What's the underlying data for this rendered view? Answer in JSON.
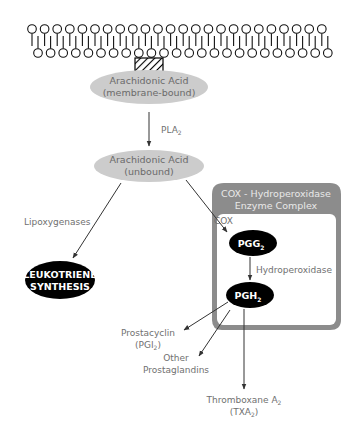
{
  "diagram": {
    "membrane": {
      "type": "phospholipid-bilayer",
      "top_heads": 24,
      "bottom_heads": 24,
      "embedded_marker": "hatched-box"
    },
    "nodes": {
      "aa_membrane": {
        "line1": "Arachidonic Acid",
        "line2": "(membrane-bound)"
      },
      "aa_unbound": {
        "line1": "Arachidonic Acid",
        "line2": "(unbound)"
      },
      "leukotriene": {
        "line1": "LEUKOTRIENE",
        "line2": "SYNTHESIS"
      },
      "pgg2": {
        "main": "PGG",
        "sub": "2"
      },
      "pgh2": {
        "main": "PGH",
        "sub": "2"
      },
      "prostacyclin": {
        "line1": "Prostacyclin",
        "line2_pre": "(PGI",
        "line2_sub": "2",
        "line2_post": ")"
      },
      "other_pg": {
        "line1": "Other",
        "line2": "Prostaglandins"
      },
      "thromboxane": {
        "line1_pre": "Thromboxane A",
        "line1_sub": "2",
        "line2_pre": "(TXA",
        "line2_sub": "2",
        "line2_post": ")"
      }
    },
    "enzymes": {
      "pla2": {
        "main": "PLA",
        "sub": "2"
      },
      "lipoxygenases": "Lipoxygenases",
      "cox": "COX",
      "hydroperoxidase": "Hydroperoxidase"
    },
    "cox_box": {
      "header_line1": "COX - Hydroperoxidase",
      "header_line2": "Enzyme Complex"
    },
    "colors": {
      "ellipse_fill": "#cccccc",
      "dark_node": "#000000",
      "box_border": "#888888",
      "header_fill": "#8c8c8c",
      "label_text": "#707070",
      "arrow": "#333333"
    }
  }
}
